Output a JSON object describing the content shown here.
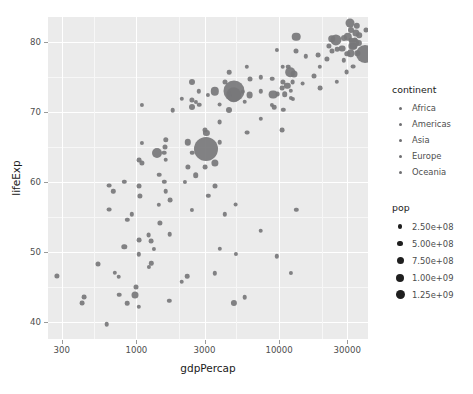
{
  "chart_data": {
    "type": "scatter",
    "title": "",
    "xlabel": "gdpPercap",
    "ylabel": "lifeExp",
    "xscale": "log",
    "yscale": "linear",
    "xticks": [
      300,
      1000,
      3000,
      10000,
      30000
    ],
    "xtick_labels": [
      "300",
      "1000",
      "3000",
      "10000",
      "30000"
    ],
    "yticks": [
      40,
      50,
      60,
      70,
      80
    ],
    "ytick_labels": [
      "40",
      "50",
      "60",
      "70",
      "80"
    ],
    "xlim": [
      240,
      42000
    ],
    "ylim": [
      37.5,
      83.5
    ],
    "grid": true,
    "legend_position": "right",
    "size_variable": "pop",
    "color_variable": "continent",
    "legends": [
      {
        "title": "continent",
        "type": "color",
        "entries": [
          {
            "label": "Africa",
            "color": "#6f6f72"
          },
          {
            "label": "Americas",
            "color": "#6f6f72"
          },
          {
            "label": "Asia",
            "color": "#6f6f72"
          },
          {
            "label": "Europe",
            "color": "#6f6f72"
          },
          {
            "label": "Oceania",
            "color": "#6f6f72"
          }
        ]
      },
      {
        "title": "pop",
        "type": "size",
        "entries": [
          {
            "label": "2.50e+08",
            "value": 250000000,
            "key_px": 4.2
          },
          {
            "label": "5.00e+08",
            "value": 500000000,
            "key_px": 5.8
          },
          {
            "label": "7.50e+08",
            "value": 750000000,
            "key_px": 7.0
          },
          {
            "label": "1.00e+09",
            "value": 1000000000,
            "key_px": 8.0
          },
          {
            "label": "1.25e+09",
            "value": 1250000000,
            "key_px": 9.0
          }
        ]
      }
    ],
    "point_color": "#77777a",
    "panel_background": "#ebebeb",
    "gridline_color": "#ffffff",
    "points": [
      {
        "x": 974,
        "y": 43.8,
        "r": 3.5,
        "continent": "Asia"
      },
      {
        "x": 5937,
        "y": 76.4,
        "r": 2.2,
        "continent": "Europe"
      },
      {
        "x": 6223,
        "y": 72.3,
        "r": 3.4,
        "continent": "Africa"
      },
      {
        "x": 4797,
        "y": 42.7,
        "r": 3.1,
        "continent": "Africa"
      },
      {
        "x": 12779,
        "y": 75.3,
        "r": 3.5,
        "continent": "Americas"
      },
      {
        "x": 34435,
        "y": 81.2,
        "r": 3.6,
        "continent": "Oceania"
      },
      {
        "x": 36126,
        "y": 79.8,
        "r": 3.1,
        "continent": "Europe"
      },
      {
        "x": 29796,
        "y": 75.6,
        "r": 2.4,
        "continent": "Asia"
      },
      {
        "x": 1391,
        "y": 64.1,
        "r": 5.0,
        "continent": "Asia"
      },
      {
        "x": 33693,
        "y": 79.4,
        "r": 3.6,
        "continent": "Europe"
      },
      {
        "x": 1441,
        "y": 56.7,
        "r": 2.2,
        "continent": "Africa"
      },
      {
        "x": 3823,
        "y": 65.6,
        "r": 2.3,
        "continent": "Americas"
      },
      {
        "x": 7446,
        "y": 74.9,
        "r": 2.2,
        "continent": "Americas"
      },
      {
        "x": 12570,
        "y": 71.8,
        "r": 2.1,
        "continent": "Asia"
      },
      {
        "x": 9066,
        "y": 72.4,
        "r": 4.4,
        "continent": "Americas"
      },
      {
        "x": 10681,
        "y": 74.2,
        "r": 2.6,
        "continent": "Europe"
      },
      {
        "x": 1217,
        "y": 52.3,
        "r": 2.4,
        "continent": "Africa"
      },
      {
        "x": 4959,
        "y": 49.6,
        "r": 2.1,
        "continent": "Africa"
      },
      {
        "x": 3820,
        "y": 50.4,
        "r": 2.2,
        "continent": "Africa"
      },
      {
        "x": 823,
        "y": 50.7,
        "r": 2.7,
        "continent": "Africa"
      },
      {
        "x": 4811,
        "y": 72.4,
        "r": 7.8,
        "continent": "Americas"
      },
      {
        "x": 9786,
        "y": 72.5,
        "r": 2.4,
        "continent": "Europe"
      },
      {
        "x": 1713,
        "y": 52.5,
        "r": 2.3,
        "continent": "Africa"
      },
      {
        "x": 1044,
        "y": 49.6,
        "r": 2.2,
        "continent": "Africa"
      },
      {
        "x": 1327,
        "y": 50.4,
        "r": 2.1,
        "continent": "Africa"
      },
      {
        "x": 13206,
        "y": 80.7,
        "r": 4.3,
        "continent": "Americas"
      },
      {
        "x": 4797,
        "y": 72.9,
        "r": 10.5,
        "continent": "Asia"
      },
      {
        "x": 13172,
        "y": 78.6,
        "r": 2.5,
        "continent": "Americas"
      },
      {
        "x": 3549,
        "y": 72.9,
        "r": 4.2,
        "continent": "Americas"
      },
      {
        "x": 1091,
        "y": 65.5,
        "r": 2.1,
        "continent": "Asia"
      },
      {
        "x": 2277,
        "y": 46.5,
        "r": 2.3,
        "continent": "Africa"
      },
      {
        "x": 4172,
        "y": 55.3,
        "r": 2.2,
        "continent": "Africa"
      },
      {
        "x": 9645,
        "y": 78.8,
        "r": 2.1,
        "continent": "Americas"
      },
      {
        "x": 2749,
        "y": 72.9,
        "r": 2.2,
        "continent": "Americas"
      },
      {
        "x": 33207,
        "y": 76.4,
        "r": 2.4,
        "continent": "Europe"
      },
      {
        "x": 35278,
        "y": 78.3,
        "r": 2.7,
        "continent": "Europe"
      },
      {
        "x": 863,
        "y": 54.5,
        "r": 2.2,
        "continent": "Africa"
      },
      {
        "x": 5581,
        "y": 72.8,
        "r": 2.3,
        "continent": "Americas"
      },
      {
        "x": 2082,
        "y": 71.8,
        "r": 2.2,
        "continent": "Americas"
      },
      {
        "x": 1056,
        "y": 58.0,
        "r": 2.6,
        "continent": "Africa"
      },
      {
        "x": 12154,
        "y": 72.0,
        "r": 2.1,
        "continent": "Africa"
      },
      {
        "x": 641,
        "y": 59.4,
        "r": 2.4,
        "continent": "Africa"
      },
      {
        "x": 690,
        "y": 58.6,
        "r": 2.2,
        "continent": "Africa"
      },
      {
        "x": 33208,
        "y": 79.3,
        "r": 3.3,
        "continent": "Europe"
      },
      {
        "x": 30470,
        "y": 80.7,
        "r": 4.2,
        "continent": "Europe"
      },
      {
        "x": 13206,
        "y": 56.0,
        "r": 2.2,
        "continent": "Africa"
      },
      {
        "x": 752,
        "y": 46.4,
        "r": 2.3,
        "continent": "Africa"
      },
      {
        "x": 32170,
        "y": 79.4,
        "r": 3.6,
        "continent": "Europe"
      },
      {
        "x": 10460,
        "y": 73.3,
        "r": 2.4,
        "continent": "Americas"
      },
      {
        "x": 1569,
        "y": 60.0,
        "r": 2.2,
        "continent": "Asia"
      },
      {
        "x": 22316,
        "y": 79.4,
        "r": 2.6,
        "continent": "Europe"
      },
      {
        "x": 2441,
        "y": 56.0,
        "r": 2.1,
        "continent": "Africa"
      },
      {
        "x": 3540,
        "y": 46.9,
        "r": 2.2,
        "continent": "Africa"
      },
      {
        "x": 11605,
        "y": 76.4,
        "r": 2.3,
        "continent": "Europe"
      },
      {
        "x": 4471,
        "y": 70.2,
        "r": 3.0,
        "continent": "Americas"
      },
      {
        "x": 3025,
        "y": 67.3,
        "r": 2.5,
        "continent": "Asia"
      },
      {
        "x": 31656,
        "y": 78.3,
        "r": 3.8,
        "continent": "Europe"
      },
      {
        "x": 3822,
        "y": 71.0,
        "r": 2.4,
        "continent": "Americas"
      },
      {
        "x": 2280,
        "y": 65.6,
        "r": 3.2,
        "continent": "Asia"
      },
      {
        "x": 1598,
        "y": 63.1,
        "r": 2.3,
        "continent": "Asia"
      },
      {
        "x": 2441,
        "y": 71.7,
        "r": 2.6,
        "continent": "Americas"
      },
      {
        "x": 5728,
        "y": 71.4,
        "r": 2.3,
        "continent": "Americas"
      },
      {
        "x": 1045,
        "y": 51.6,
        "r": 2.4,
        "continent": "Africa"
      },
      {
        "x": 19329,
        "y": 76.4,
        "r": 2.2,
        "continent": "Asia"
      },
      {
        "x": 2602,
        "y": 71.4,
        "r": 2.1,
        "continent": "Asia"
      },
      {
        "x": 4172,
        "y": 74.2,
        "r": 2.5,
        "continent": "Americas"
      },
      {
        "x": 7408,
        "y": 72.9,
        "r": 2.2,
        "continent": "Asia"
      },
      {
        "x": 3095,
        "y": 64.7,
        "r": 12.0,
        "continent": "Asia"
      },
      {
        "x": 2452,
        "y": 70.6,
        "r": 3.0,
        "continent": "Asia"
      },
      {
        "x": 31656,
        "y": 80.2,
        "r": 2.5,
        "continent": "Europe"
      },
      {
        "x": 25523,
        "y": 78.9,
        "r": 2.3,
        "continent": "Europe"
      },
      {
        "x": 28569,
        "y": 80.5,
        "r": 3.0,
        "continent": "Europe"
      },
      {
        "x": 31163,
        "y": 82.6,
        "r": 4.5,
        "continent": "Asia"
      },
      {
        "x": 4519,
        "y": 72.5,
        "r": 2.3,
        "continent": "Asia"
      },
      {
        "x": 1463,
        "y": 54.1,
        "r": 2.6,
        "continent": "Africa"
      },
      {
        "x": 23348,
        "y": 78.6,
        "r": 2.5,
        "continent": "Asia"
      },
      {
        "x": 47306,
        "y": 75.6,
        "r": 2.1,
        "continent": "Asia"
      },
      {
        "x": 10461,
        "y": 67.3,
        "r": 2.4,
        "continent": "Asia"
      },
      {
        "x": 1569,
        "y": 64.1,
        "r": 2.3,
        "continent": "Asia"
      },
      {
        "x": 414,
        "y": 42.6,
        "r": 2.4,
        "continent": "Africa"
      },
      {
        "x": 12057,
        "y": 73.0,
        "r": 2.2,
        "continent": "Europe"
      },
      {
        "x": 1044,
        "y": 42.1,
        "r": 2.2,
        "continent": "Africa"
      },
      {
        "x": 759,
        "y": 43.8,
        "r": 2.3,
        "continent": "Africa"
      },
      {
        "x": 12451,
        "y": 74.2,
        "r": 2.4,
        "continent": "Asia"
      },
      {
        "x": 1042,
        "y": 59.4,
        "r": 2.5,
        "continent": "Africa"
      },
      {
        "x": 1803,
        "y": 70.2,
        "r": 2.3,
        "continent": "Asia"
      },
      {
        "x": 10956,
        "y": 72.5,
        "r": 2.8,
        "continent": "Americas"
      },
      {
        "x": 11977,
        "y": 75.6,
        "r": 4.8,
        "continent": "Americas"
      },
      {
        "x": 3095,
        "y": 67.0,
        "r": 3.1,
        "continent": "Asia"
      },
      {
        "x": 33859,
        "y": 80.2,
        "r": 2.6,
        "continent": "Europe"
      },
      {
        "x": 25185,
        "y": 80.2,
        "r": 5.6,
        "continent": "Europe"
      },
      {
        "x": 23458,
        "y": 80.4,
        "r": 3.8,
        "continent": "Oceania"
      },
      {
        "x": 1091,
        "y": 62.7,
        "r": 2.6,
        "continent": "Asia"
      },
      {
        "x": 641,
        "y": 56.0,
        "r": 2.4,
        "continent": "Africa"
      },
      {
        "x": 3190,
        "y": 72.4,
        "r": 2.1,
        "continent": "Americas"
      },
      {
        "x": 2749,
        "y": 71.0,
        "r": 2.3,
        "continent": "Americas"
      },
      {
        "x": 3548,
        "y": 62.7,
        "r": 3.6,
        "continent": "Asia"
      },
      {
        "x": 1597,
        "y": 65.0,
        "r": 2.5,
        "continent": "Asia"
      },
      {
        "x": 15389,
        "y": 77.9,
        "r": 2.2,
        "continent": "Europe"
      },
      {
        "x": 18678,
        "y": 78.1,
        "r": 2.4,
        "continent": "Europe"
      },
      {
        "x": 8948,
        "y": 74.7,
        "r": 2.3,
        "continent": "Americas"
      },
      {
        "x": 2601,
        "y": 60.9,
        "r": 2.8,
        "continent": "Africa"
      },
      {
        "x": 30029,
        "y": 78.2,
        "r": 2.7,
        "continent": "Europe"
      },
      {
        "x": 33692,
        "y": 79.8,
        "r": 4.8,
        "continent": "Europe"
      },
      {
        "x": 39725,
        "y": 78.2,
        "r": 9.0,
        "continent": "Americas"
      },
      {
        "x": 10611,
        "y": 76.4,
        "r": 2.3,
        "continent": "Americas"
      },
      {
        "x": 11416,
        "y": 73.7,
        "r": 3.2,
        "continent": "Americas"
      },
      {
        "x": 2441,
        "y": 74.2,
        "r": 3.0,
        "continent": "Asia"
      },
      {
        "x": 3025,
        "y": 62.1,
        "r": 2.4,
        "continent": "Asia"
      },
      {
        "x": 619,
        "y": 39.6,
        "r": 2.3,
        "continent": "Africa"
      },
      {
        "x": 430,
        "y": 43.5,
        "r": 2.4,
        "continent": "Africa"
      },
      {
        "x": 706,
        "y": 47.0,
        "r": 2.2,
        "continent": "Africa"
      },
      {
        "x": 986,
        "y": 45.0,
        "r": 2.5,
        "continent": "Africa"
      },
      {
        "x": 277,
        "y": 46.5,
        "r": 2.6,
        "continent": "Africa"
      },
      {
        "x": 863,
        "y": 42.6,
        "r": 2.3,
        "continent": "Africa"
      },
      {
        "x": 1271,
        "y": 48.3,
        "r": 2.2,
        "continent": "Africa"
      },
      {
        "x": 1217,
        "y": 47.8,
        "r": 2.1,
        "continent": "Africa"
      },
      {
        "x": 2082,
        "y": 45.7,
        "r": 2.3,
        "continent": "Africa"
      },
      {
        "x": 1704,
        "y": 43.0,
        "r": 2.2,
        "continent": "Africa"
      },
      {
        "x": 541,
        "y": 48.2,
        "r": 2.5,
        "continent": "Africa"
      },
      {
        "x": 1271,
        "y": 51.5,
        "r": 2.4,
        "continent": "Africa"
      },
      {
        "x": 930,
        "y": 55.3,
        "r": 2.2,
        "continent": "Africa"
      },
      {
        "x": 1598,
        "y": 58.6,
        "r": 2.3,
        "continent": "Africa"
      },
      {
        "x": 1714,
        "y": 57.3,
        "r": 2.4,
        "continent": "Africa"
      },
      {
        "x": 2194,
        "y": 60.0,
        "r": 2.1,
        "continent": "Africa"
      },
      {
        "x": 3570,
        "y": 59.4,
        "r": 2.5,
        "continent": "Africa"
      },
      {
        "x": 1441,
        "y": 61.0,
        "r": 2.3,
        "continent": "Asia"
      },
      {
        "x": 1045,
        "y": 63.1,
        "r": 2.4,
        "continent": "Asia"
      },
      {
        "x": 823,
        "y": 60.0,
        "r": 2.2,
        "continent": "Asia"
      },
      {
        "x": 2280,
        "y": 62.1,
        "r": 2.6,
        "continent": "Asia"
      },
      {
        "x": 1598,
        "y": 66.0,
        "r": 2.7,
        "continent": "Asia"
      },
      {
        "x": 2452,
        "y": 64.1,
        "r": 2.3,
        "continent": "Asia"
      },
      {
        "x": 3190,
        "y": 58.0,
        "r": 2.2,
        "continent": "Africa"
      },
      {
        "x": 4959,
        "y": 56.7,
        "r": 2.4,
        "continent": "Africa"
      },
      {
        "x": 7408,
        "y": 53.0,
        "r": 2.3,
        "continent": "Africa"
      },
      {
        "x": 9645,
        "y": 49.3,
        "r": 2.2,
        "continent": "Africa"
      },
      {
        "x": 12154,
        "y": 47.0,
        "r": 2.1,
        "continent": "Africa"
      },
      {
        "x": 5728,
        "y": 43.5,
        "r": 2.3,
        "continent": "Africa"
      },
      {
        "x": 10681,
        "y": 70.2,
        "r": 2.2,
        "continent": "Asia"
      },
      {
        "x": 19329,
        "y": 73.3,
        "r": 2.4,
        "continent": "Asia"
      },
      {
        "x": 25523,
        "y": 74.2,
        "r": 2.2,
        "continent": "Asia"
      },
      {
        "x": 4471,
        "y": 75.6,
        "r": 2.3,
        "continent": "Americas"
      },
      {
        "x": 6223,
        "y": 74.7,
        "r": 2.5,
        "continent": "Americas"
      },
      {
        "x": 8948,
        "y": 71.0,
        "r": 2.1,
        "continent": "Americas"
      },
      {
        "x": 3822,
        "y": 68.5,
        "r": 2.4,
        "continent": "Americas"
      },
      {
        "x": 28569,
        "y": 77.3,
        "r": 2.2,
        "continent": "Europe"
      },
      {
        "x": 36319,
        "y": 80.9,
        "r": 2.8,
        "continent": "Europe"
      },
      {
        "x": 40676,
        "y": 81.7,
        "r": 2.5,
        "continent": "Europe"
      },
      {
        "x": 35110,
        "y": 82.2,
        "r": 3.2,
        "continent": "Asia"
      },
      {
        "x": 31656,
        "y": 81.7,
        "r": 3.0,
        "continent": "Europe"
      },
      {
        "x": 27538,
        "y": 79.0,
        "r": 3.4,
        "continent": "Europe"
      },
      {
        "x": 21654,
        "y": 77.5,
        "r": 2.6,
        "continent": "Europe"
      },
      {
        "x": 17581,
        "y": 75.1,
        "r": 2.5,
        "continent": "Europe"
      },
      {
        "x": 14619,
        "y": 74.0,
        "r": 2.4,
        "continent": "Europe"
      },
      {
        "x": 9253,
        "y": 70.6,
        "r": 2.3,
        "continent": "Europe"
      },
      {
        "x": 7446,
        "y": 69.0,
        "r": 2.2,
        "continent": "Europe"
      },
      {
        "x": 5937,
        "y": 67.0,
        "r": 2.4,
        "continent": "Asia"
      },
      {
        "x": 1091,
        "y": 71.0,
        "r": 2.1,
        "continent": "Asia"
      }
    ]
  },
  "axes": {
    "x": {
      "label": "gdpPercap",
      "ticks": [
        "300",
        "1000",
        "3000",
        "10000",
        "30000"
      ]
    },
    "y": {
      "label": "lifeExp",
      "ticks": [
        "40",
        "50",
        "60",
        "70",
        "80"
      ]
    }
  },
  "legend_continent": {
    "title": "continent",
    "items": [
      "Africa",
      "Americas",
      "Asia",
      "Europe",
      "Oceania"
    ]
  },
  "legend_pop": {
    "title": "pop",
    "items": [
      "2.50e+08",
      "5.00e+08",
      "7.50e+08",
      "1.00e+09",
      "1.25e+09"
    ]
  }
}
